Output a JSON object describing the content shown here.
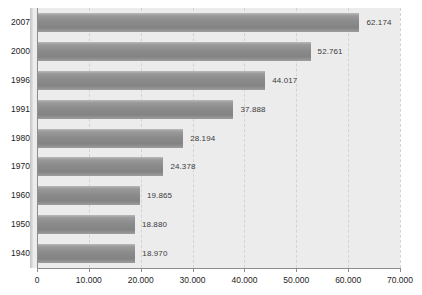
{
  "chart_data": {
    "type": "bar",
    "orientation": "horizontal",
    "title": "",
    "subtitle": "",
    "xlabel": "",
    "ylabel": "",
    "categories": [
      "2007",
      "2000",
      "1996",
      "1991",
      "1980",
      "1970",
      "1960",
      "1950",
      "1940"
    ],
    "values": [
      62174,
      52761,
      44017,
      37888,
      28194,
      24378,
      19865,
      18880,
      18970
    ],
    "value_labels": [
      "62.174",
      "52.761",
      "44.017",
      "37.888",
      "28.194",
      "24.378",
      "19.865",
      "18.880",
      "18.970"
    ],
    "xlim": [
      0,
      70000
    ],
    "xticks": [
      0,
      10000,
      20000,
      30000,
      40000,
      50000,
      60000,
      70000
    ],
    "xtick_labels": [
      "0",
      "10.000",
      "20.000",
      "30.000",
      "40.000",
      "50.000",
      "60.000",
      "70.000"
    ],
    "grid": true,
    "grid_axis": "x",
    "grid_style": "dashed",
    "legend": false,
    "legend_position": "none",
    "decimal_separator": "thousands-dot",
    "series": [
      {
        "name": "",
        "values": [
          62174,
          52761,
          44017,
          37888,
          28194,
          24378,
          19865,
          18880,
          18970
        ]
      }
    ]
  },
  "style": {
    "plot_background": "#ececed",
    "bar_color": "#8b8b8c",
    "bar_highlight": "#b9b9ba",
    "grid_color": "#d3d3d4",
    "axis_color": "#8d8d8e",
    "text_color": "#1d1d1e",
    "value_text_color": "#3b3b3c",
    "page_background": "#ffffff"
  }
}
